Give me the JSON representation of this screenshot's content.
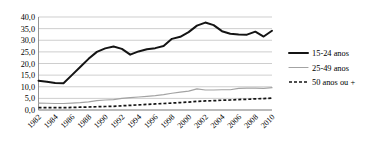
{
  "chart_data": {
    "type": "line",
    "title": "",
    "subtitle": "",
    "xlabel": "",
    "ylabel": "",
    "x": [
      1982,
      1983,
      1984,
      1985,
      1986,
      1987,
      1988,
      1989,
      1990,
      1991,
      1992,
      1993,
      1994,
      1995,
      1996,
      1997,
      1998,
      1999,
      2000,
      2001,
      2002,
      2003,
      2004,
      2005,
      2006,
      2007,
      2008,
      2009,
      2010
    ],
    "xtick_labels": [
      "1982",
      "1984",
      "1986",
      "1988",
      "1990",
      "1992",
      "1994",
      "1996",
      "1998",
      "2000",
      "2002",
      "2004",
      "2006",
      "2008",
      "2010"
    ],
    "xticks": [
      1982,
      1984,
      1986,
      1988,
      1990,
      1992,
      1994,
      1996,
      1998,
      2000,
      2002,
      2004,
      2006,
      2008,
      2010
    ],
    "ytick_labels": [
      "40,0",
      "35,0",
      "30,0",
      "25,0",
      "20,0",
      "15,0",
      "10,0",
      "5,0",
      "0,0"
    ],
    "yticks": [
      40.0,
      35.0,
      30.0,
      25.0,
      20.0,
      15.0,
      10.0,
      5.0,
      0.0
    ],
    "ylim": [
      0.0,
      40.0
    ],
    "xlim": [
      1982,
      2010
    ],
    "grid": true,
    "legend_position": "right",
    "series": [
      {
        "name": "15-24 anos",
        "style": "solid-thick",
        "color": "#141414",
        "values": [
          12.6,
          12.2,
          11.6,
          11.5,
          15.0,
          18.5,
          22.0,
          25.0,
          26.5,
          27.3,
          26.3,
          23.8,
          25.2,
          26.1,
          26.6,
          27.5,
          30.6,
          31.5,
          33.5,
          36.3,
          37.6,
          36.5,
          33.9,
          32.8,
          32.5,
          32.4,
          33.7,
          31.6,
          34.1
        ]
      },
      {
        "name": "25-49 anos",
        "style": "solid-thin",
        "color": "#a3a3a3",
        "values": [
          3.0,
          2.9,
          2.8,
          2.8,
          3.0,
          3.2,
          3.5,
          4.0,
          4.3,
          4.5,
          5.0,
          5.3,
          5.6,
          5.9,
          6.2,
          6.6,
          7.2,
          7.7,
          8.1,
          9.1,
          8.6,
          8.6,
          8.7,
          8.7,
          9.3,
          9.4,
          9.4,
          9.3,
          9.6
        ]
      },
      {
        "name": "50 anos ou +",
        "style": "dashed",
        "color": "#141414",
        "values": [
          1.0,
          1.0,
          1.0,
          1.0,
          1.1,
          1.2,
          1.3,
          1.4,
          1.5,
          1.6,
          1.8,
          2.0,
          2.2,
          2.4,
          2.6,
          2.8,
          3.0,
          3.2,
          3.4,
          3.7,
          3.9,
          4.0,
          4.2,
          4.3,
          4.5,
          4.6,
          4.8,
          4.9,
          5.1
        ]
      }
    ]
  },
  "legend": {
    "items": [
      {
        "label": "15-24 anos",
        "swatch": "solid-thick-black"
      },
      {
        "label": "25-49 anos",
        "swatch": "solid-thin-gray"
      },
      {
        "label": "50 anos ou +",
        "swatch": "dashed-black"
      }
    ]
  }
}
